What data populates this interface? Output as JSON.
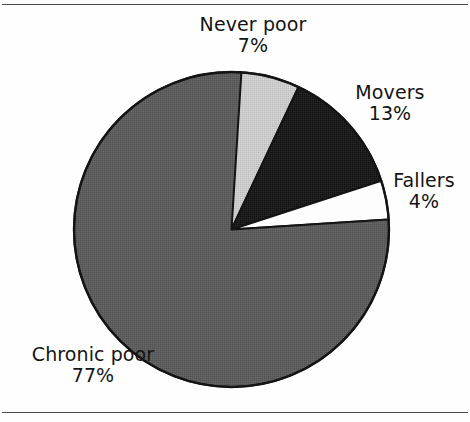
{
  "figure": {
    "background": "#fefefe",
    "rule_color": "#4a4a4a",
    "has_top_rule": true,
    "has_bottom_rule": true
  },
  "chart_data": {
    "type": "pie",
    "title": "",
    "xlabel": "",
    "ylabel": "",
    "legend_position": "none",
    "grid": false,
    "start_angle_deg": 0,
    "direction": "clockwise",
    "unit": "%",
    "categories": [
      "Never poor",
      "Movers",
      "Fallers",
      "Chronic poor"
    ],
    "values": [
      7,
      13,
      4,
      77
    ],
    "total": 101,
    "slices": [
      {
        "label": "Never poor",
        "value": 7,
        "value_text": "7%",
        "color": "#c9c9c9",
        "start_deg": 0,
        "end_deg": 25.2
      },
      {
        "label": "Movers",
        "value": 13,
        "value_text": "13%",
        "color": "#1c1c1c",
        "start_deg": 25.2,
        "end_deg": 72.0
      },
      {
        "label": "Fallers",
        "value": 4,
        "value_text": "4%",
        "color": "#fdfdfd",
        "start_deg": 72.0,
        "end_deg": 86.4
      },
      {
        "label": "Chronic poor",
        "value": 77,
        "value_text": "77%",
        "color": "#5d5d5d",
        "start_deg": 86.4,
        "end_deg": 363.6
      }
    ],
    "outline_color": "#141414"
  },
  "labels": {
    "never_poor": {
      "name": "Never poor",
      "percent": "7%"
    },
    "movers": {
      "name": "Movers",
      "percent": "13%"
    },
    "fallers": {
      "name": "Fallers",
      "percent": "4%"
    },
    "chronic_poor": {
      "name": "Chronic poor",
      "percent": "77%"
    }
  }
}
